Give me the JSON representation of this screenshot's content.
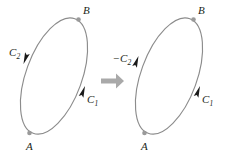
{
  "figure": {
    "width": 225,
    "height": 160,
    "background_color": "#ffffff",
    "curve_color": "#8c8c8c",
    "node_color": "#9a9a9a",
    "arrow_color": "#1a1a1a",
    "transition_arrow_color": "#a9a9a9"
  },
  "left_panel": {
    "name": "original-orientation",
    "ellipse": {
      "center_x": 54,
      "center_y": 76,
      "radius_x": 28,
      "radius_y": 61,
      "rotation_deg": 20
    },
    "points": [
      {
        "label": "B",
        "x": 78.5,
        "y": 19.5,
        "label_x": 83,
        "label_y": 14
      },
      {
        "label": "A",
        "x": 29.5,
        "y": 133.0,
        "label_x": 26,
        "label_y": 150
      }
    ],
    "arcs": [
      {
        "label": "C",
        "subscript": "2",
        "sign": "",
        "label_x": 9,
        "label_y": 56,
        "direction": "downward",
        "arrow_x": 23.5,
        "arrow_y": 64.0,
        "arrow_angle_deg": 110
      },
      {
        "label": "C",
        "subscript": "1",
        "sign": "",
        "label_x": 87,
        "label_y": 103,
        "direction": "upward",
        "arrow_x": 85.0,
        "arrow_y": 86.0,
        "arrow_angle_deg": -70
      }
    ]
  },
  "transition": {
    "name": "implies-arrow",
    "symbol": "⟹",
    "x": 101,
    "y": 73,
    "width": 23,
    "height": 14
  },
  "right_panel": {
    "name": "reversed-orientation",
    "ellipse": {
      "center_x": 169,
      "center_y": 76,
      "radius_x": 28,
      "radius_y": 61,
      "rotation_deg": 20
    },
    "points": [
      {
        "label": "B",
        "x": 193.5,
        "y": 19.5,
        "label_x": 198,
        "label_y": 14
      },
      {
        "label": "A",
        "x": 144.5,
        "y": 133.0,
        "label_x": 141,
        "label_y": 150
      }
    ],
    "arcs": [
      {
        "label": "C",
        "subscript": "2",
        "sign": "−",
        "label_x": 114,
        "label_y": 62,
        "direction": "upward",
        "arrow_x": 138.5,
        "arrow_y": 56.0,
        "arrow_angle_deg": -70
      },
      {
        "label": "C",
        "subscript": "1",
        "sign": "",
        "label_x": 202,
        "label_y": 103,
        "direction": "upward",
        "arrow_x": 200.0,
        "arrow_y": 86.0,
        "arrow_angle_deg": -70
      }
    ]
  }
}
